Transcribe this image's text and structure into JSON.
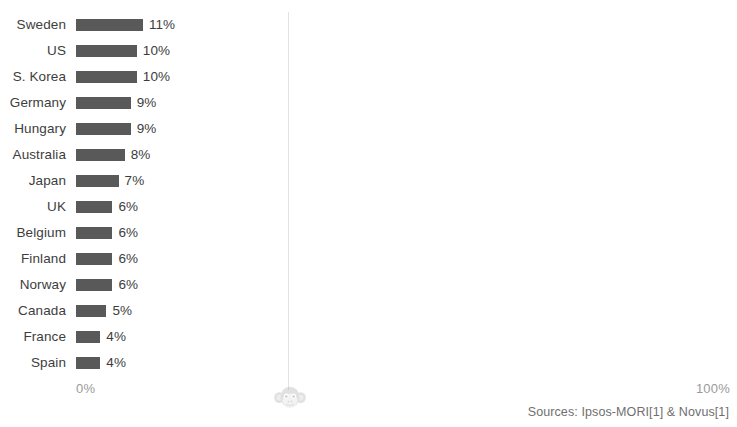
{
  "chart_data": {
    "type": "bar",
    "orientation": "horizontal",
    "title": "",
    "clipped_title": "",
    "xlabel": "",
    "ylabel": "",
    "xlim": [
      0,
      100
    ],
    "grid": false,
    "legend": null,
    "categories": [
      "Sweden",
      "US",
      "S. Korea",
      "Germany",
      "Hungary",
      "Australia",
      "Japan",
      "UK",
      "Belgium",
      "Finland",
      "Norway",
      "Canada",
      "France",
      "Spain"
    ],
    "values": [
      11,
      10,
      10,
      9,
      9,
      8,
      7,
      6,
      6,
      6,
      6,
      5,
      4,
      4
    ],
    "value_labels": [
      "11%",
      "10%",
      "10%",
      "9%",
      "9%",
      "8%",
      "7%",
      "6%",
      "6%",
      "6%",
      "6%",
      "5%",
      "4%",
      "4%"
    ],
    "bar_color": "#595959",
    "axis_ticks": {
      "min_label": "0%",
      "max_label": "100%"
    }
  },
  "footer": {
    "sources": "Sources: Ipsos-MORI[1] & Novus[1]"
  },
  "watermark": {
    "name": "monkey-face-watermark"
  }
}
